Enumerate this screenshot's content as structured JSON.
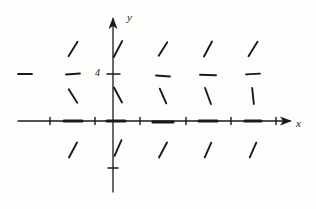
{
  "figure": {
    "kind": "slope-field",
    "background_color": "#fdfdfc",
    "ink_color": "#1a1a1a"
  },
  "axes": {
    "x_axis": {
      "label": "x",
      "arrow": "right",
      "origin_px": 113,
      "y_px": 121,
      "start_px": 18,
      "end_px": 292
    },
    "y_axis": {
      "label": "y",
      "arrow": "up",
      "x_px": 113,
      "origin_px": 121,
      "start_px": 192,
      "end_px": 17
    },
    "tick_labels": [
      {
        "text": "4",
        "axis": "y",
        "value": 4
      }
    ]
  },
  "chart_data": {
    "type": "scatter",
    "title": "",
    "xlabel": "x",
    "ylabel": "y",
    "grid": false,
    "legend": null,
    "xlim": [
      -3.5,
      4.0
    ],
    "ylim": [
      -2.5,
      6.5
    ],
    "y_tick_values": [
      4
    ],
    "x_tick_values": [
      -2,
      -1.5,
      -1,
      -0.5,
      0.5,
      1,
      1.5,
      2,
      2.5,
      3
    ],
    "segment_columns_x": [
      -3,
      -2,
      -1,
      0,
      1,
      2,
      3
    ],
    "segment_rows_y": [
      5,
      4,
      3,
      0,
      -1
    ],
    "segments": [
      {
        "x": -2,
        "y": 5,
        "slope_glyph": "backslash",
        "angle_deg": -58,
        "length": 17,
        "px": 73,
        "py": 49
      },
      {
        "x": -1,
        "y": 5,
        "slope_glyph": "backslash",
        "angle_deg": -62,
        "length": 18,
        "px": 118,
        "py": 49
      },
      {
        "x": 1,
        "y": 5,
        "slope_glyph": "backslash",
        "angle_deg": -58,
        "length": 16,
        "px": 163,
        "py": 49
      },
      {
        "x": 2,
        "y": 5,
        "slope_glyph": "backslash",
        "angle_deg": -62,
        "length": 17,
        "px": 208,
        "py": 49
      },
      {
        "x": 3,
        "y": 5,
        "slope_glyph": "backslash",
        "angle_deg": -58,
        "length": 17,
        "px": 253,
        "py": 49
      },
      {
        "x": -3,
        "y": 4,
        "slope_glyph": "horizontal",
        "angle_deg": 0,
        "length": 14,
        "px": 25,
        "py": 74
      },
      {
        "x": -2,
        "y": 4,
        "slope_glyph": "horizontal",
        "angle_deg": -4,
        "length": 14,
        "px": 73,
        "py": 74
      },
      {
        "x": 1,
        "y": 4,
        "slope_glyph": "horizontal",
        "angle_deg": 4,
        "length": 14,
        "px": 163,
        "py": 76
      },
      {
        "x": 2,
        "y": 4,
        "slope_glyph": "horizontal",
        "angle_deg": 2,
        "length": 16,
        "px": 208,
        "py": 75
      },
      {
        "x": 3,
        "y": 4,
        "slope_glyph": "horizontal",
        "angle_deg": -3,
        "length": 14,
        "px": 253,
        "py": 74
      },
      {
        "x": -2,
        "y": 3,
        "slope_glyph": "forwardslash",
        "angle_deg": 58,
        "length": 16,
        "px": 73,
        "py": 96
      },
      {
        "x": -1,
        "y": 3,
        "slope_glyph": "forwardslash",
        "angle_deg": 62,
        "length": 17,
        "px": 118,
        "py": 95
      },
      {
        "x": 1,
        "y": 3,
        "slope_glyph": "forwardslash",
        "angle_deg": 66,
        "length": 16,
        "px": 163,
        "py": 96
      },
      {
        "x": 2,
        "y": 3,
        "slope_glyph": "forwardslash",
        "angle_deg": 70,
        "length": 17,
        "px": 208,
        "py": 96
      },
      {
        "x": 3,
        "y": 3,
        "slope_glyph": "vertical",
        "angle_deg": 84,
        "length": 16,
        "px": 253,
        "py": 96
      },
      {
        "x": -2,
        "y": 0,
        "slope_glyph": "horizontal-thick",
        "angle_deg": 0,
        "length": 18,
        "px": 73,
        "py": 121
      },
      {
        "x": 0,
        "y": 0,
        "slope_glyph": "horizontal-thick",
        "angle_deg": 0,
        "length": 18,
        "px": 116,
        "py": 121
      },
      {
        "x": 1,
        "y": 0,
        "slope_glyph": "horizontal-thick",
        "angle_deg": 0,
        "length": 20,
        "px": 163,
        "py": 122
      },
      {
        "x": 2,
        "y": 0,
        "slope_glyph": "horizontal-thick",
        "angle_deg": 0,
        "length": 18,
        "px": 208,
        "py": 121
      },
      {
        "x": 3,
        "y": 0,
        "slope_glyph": "horizontal-thick",
        "angle_deg": 0,
        "length": 16,
        "px": 253,
        "py": 121
      },
      {
        "x": -2,
        "y": -1,
        "slope_glyph": "backslash",
        "angle_deg": -62,
        "length": 17,
        "px": 73,
        "py": 150
      },
      {
        "x": -1,
        "y": -1,
        "slope_glyph": "backslash",
        "angle_deg": -66,
        "length": 17,
        "px": 118,
        "py": 148
      },
      {
        "x": 1,
        "y": -1,
        "slope_glyph": "backslash",
        "angle_deg": -62,
        "length": 17,
        "px": 163,
        "py": 150
      },
      {
        "x": 2,
        "y": -1,
        "slope_glyph": "backslash",
        "angle_deg": -66,
        "length": 16,
        "px": 208,
        "py": 150
      },
      {
        "x": 3,
        "y": -1,
        "slope_glyph": "backslash",
        "angle_deg": -66,
        "length": 16,
        "px": 253,
        "py": 150
      }
    ]
  }
}
